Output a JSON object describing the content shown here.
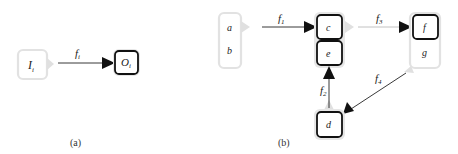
{
  "panel_a": {
    "caption": "(a)",
    "input_node": {
      "label": "I",
      "sub": "i",
      "style": "faded"
    },
    "output_node": {
      "label": "O",
      "sub": "i",
      "style": "bold"
    },
    "edge": {
      "label": "f",
      "sub": "i"
    }
  },
  "panel_b": {
    "caption": "(b)",
    "nodes": [
      {
        "id": "ab",
        "labels": [
          "a",
          "b"
        ],
        "style": "faded"
      },
      {
        "id": "c",
        "label": "c",
        "style": "bold"
      },
      {
        "id": "e",
        "label": "e",
        "style": "bold"
      },
      {
        "id": "fg",
        "labels": [
          "f",
          "g"
        ],
        "style": "faded-group",
        "bold_member": "f"
      },
      {
        "id": "d",
        "label": "d",
        "style": "bold"
      }
    ],
    "edges": [
      {
        "label": "f",
        "sub": "1",
        "from": "a,b",
        "to": "c"
      },
      {
        "label": "f",
        "sub": "2",
        "from": "d",
        "to": "e"
      },
      {
        "label": "f",
        "sub": "3",
        "from": "c,e",
        "to": "f"
      },
      {
        "label": "f",
        "sub": "4",
        "from": "g",
        "to": "d"
      }
    ]
  },
  "colors": {
    "bold_stroke": "#111111",
    "faded_stroke": "#e2e2e2",
    "halo": "#e6e6e6",
    "edge": "#222222"
  }
}
